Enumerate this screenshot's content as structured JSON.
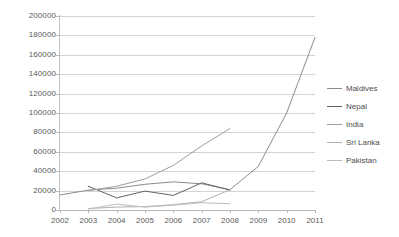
{
  "chart_data": {
    "type": "line",
    "title": "",
    "subtitle": "",
    "xlabel": "",
    "ylabel": "",
    "x": [
      2002,
      2003,
      2004,
      2005,
      2006,
      2007,
      2008,
      2009,
      2010,
      2011
    ],
    "xtick_labels": [
      "2002",
      "2003",
      "2004",
      "2005",
      "2006",
      "2007",
      "2008",
      "2009",
      "2010",
      "2011"
    ],
    "ytick_labels": [
      "0",
      "20000",
      "40000",
      "60000",
      "80000",
      "100000",
      "120000",
      "140000",
      "160000",
      "180000",
      "200000"
    ],
    "ytick_values": [
      0,
      20000,
      40000,
      60000,
      80000,
      100000,
      120000,
      140000,
      160000,
      180000,
      200000
    ],
    "ylim": [
      0,
      200000
    ],
    "xlim": [
      2002,
      2011
    ],
    "grid": true,
    "grid_axis": "y",
    "legend_position": "right",
    "series": [
      {
        "name": "Maldives",
        "color": "#8c8c8c",
        "x": [
          2002,
          2003,
          2004,
          2005,
          2006,
          2007,
          2008,
          2009,
          2010,
          2011
        ],
        "values": [
          15500,
          20500,
          22500,
          26500,
          29000,
          27000,
          21000,
          45000,
          100000,
          178000
        ]
      },
      {
        "name": "Nepal",
        "color": "#636363",
        "x": [
          2003,
          2004,
          2005,
          2006,
          2007,
          2008
        ],
        "values": [
          24500,
          12500,
          19500,
          15000,
          28000,
          20500
        ]
      },
      {
        "name": "India",
        "color": "#9e9e9e",
        "x": [
          2003,
          2004,
          2005,
          2006,
          2007,
          2008
        ],
        "values": [
          20000,
          24500,
          32000,
          46000,
          66000,
          84000
        ]
      },
      {
        "name": "Sri Lanka",
        "color": "#b0b0b0",
        "x": [
          2003,
          2004,
          2005,
          2006,
          2007,
          2008
        ],
        "values": [
          1500,
          3000,
          3500,
          5500,
          8500,
          21000
        ]
      },
      {
        "name": "Pakistan",
        "color": "#bdbdbd",
        "x": [
          2003,
          2004,
          2005,
          2006,
          2007,
          2008
        ],
        "values": [
          1000,
          6000,
          3000,
          5000,
          7500,
          6500
        ]
      }
    ]
  },
  "legend": {
    "entries": [
      {
        "label": "Maldives"
      },
      {
        "label": "Nepal"
      },
      {
        "label": "India"
      },
      {
        "label": "Sri Lanka"
      },
      {
        "label": "Pakistan"
      }
    ]
  },
  "colors": {
    "grid": "#d4d4d4",
    "axis": "#b9b9b9",
    "tick_text": "#5a5a5a",
    "legend_text": "#4d4d4d",
    "background": "#ffffff"
  }
}
